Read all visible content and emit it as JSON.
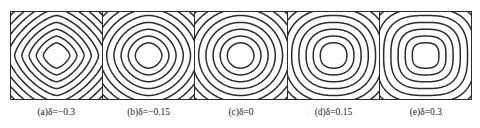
{
  "figure": {
    "name": "contour-panel-series",
    "background": "#ffffff",
    "line_color": "#2b2b2b",
    "frame_color": "#2b2b2b"
  },
  "chart_data": {
    "type": "contour",
    "title": "",
    "xlabel": "",
    "ylabel": "",
    "grid": false,
    "legend": null,
    "shared": {
      "n_contours": 9,
      "center": [
        0.5,
        0.5
      ],
      "contour_levels": [
        0.08,
        0.17,
        0.26,
        0.35,
        0.44,
        0.53,
        0.62,
        0.71,
        0.8
      ],
      "axis_ranges": {
        "x": [
          -1,
          1
        ],
        "y": [
          -1,
          1
        ]
      }
    },
    "panels": [
      {
        "id": "a",
        "label": "(a)",
        "parameter_symbol": "δ",
        "parameter_value": -0.3,
        "caption": "(a)δ=−0.3",
        "shape": "diamond-rounded",
        "superellipse_exponent": 1.45,
        "rotation_deg": 0,
        "aspect": 1.0,
        "n_contours": 9
      },
      {
        "id": "b",
        "label": "(b)",
        "parameter_symbol": "δ",
        "parameter_value": -0.15,
        "caption": "(b)δ=−0.15",
        "shape": "near-circular",
        "superellipse_exponent": 1.8,
        "rotation_deg": 0,
        "aspect": 1.0,
        "n_contours": 9
      },
      {
        "id": "c",
        "label": "(c)",
        "parameter_symbol": "δ",
        "parameter_value": 0,
        "caption": "(c)δ=0",
        "shape": "circular",
        "superellipse_exponent": 2.0,
        "rotation_deg": 0,
        "aspect": 1.0,
        "n_contours": 9
      },
      {
        "id": "d",
        "label": "(d)",
        "parameter_symbol": "δ",
        "parameter_value": 0.15,
        "caption": "(d)δ=0.15",
        "shape": "rounded-square",
        "superellipse_exponent": 2.3,
        "rotation_deg": 0,
        "aspect": 1.0,
        "n_contours": 9
      },
      {
        "id": "e",
        "label": "(e)",
        "parameter_symbol": "δ",
        "parameter_value": 0.3,
        "caption": "(e)δ=0.3",
        "shape": "rounded-square",
        "superellipse_exponent": 2.8,
        "rotation_deg": 0,
        "aspect": 1.0,
        "n_contours": 9
      }
    ]
  }
}
